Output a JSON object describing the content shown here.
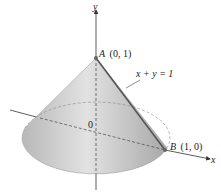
{
  "diagram": {
    "axes": {
      "y_label": "y",
      "x_label": "x",
      "origin_label": "0"
    },
    "points": [
      {
        "name": "A",
        "coords": "(0, 1)"
      },
      {
        "name": "B",
        "coords": "(1, 0)"
      }
    ],
    "line_label": "x + y = 1",
    "colors": {
      "cone_fill": "#c8c8c8",
      "cone_edge": "#9a9a9a",
      "axis": "#333333",
      "generator_line": "#555555"
    }
  }
}
